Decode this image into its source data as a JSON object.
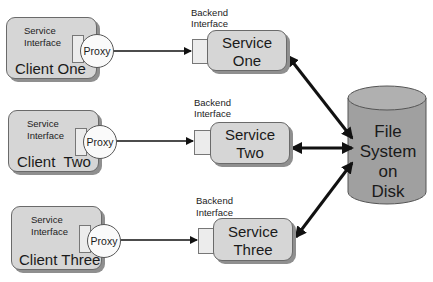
{
  "clients": [
    {
      "name": "Client One",
      "interface_label": [
        "Service",
        "Interface"
      ],
      "proxy_label": "Proxy"
    },
    {
      "name": "Client  Two",
      "interface_label": [
        "Service",
        "Interface"
      ],
      "proxy_label": "Proxy"
    },
    {
      "name": "Client Three",
      "interface_label": [
        "Service",
        "Interface"
      ],
      "proxy_label": "Proxy"
    }
  ],
  "services": [
    {
      "name_line1": "Service",
      "name_line2": "One",
      "interface_label": [
        "Backend",
        "Interface"
      ]
    },
    {
      "name_line1": "Service",
      "name_line2": "Two",
      "interface_label": [
        "Backend",
        "Interface"
      ]
    },
    {
      "name_line1": "Service",
      "name_line2": "Three",
      "interface_label": [
        "Backend",
        "Interface"
      ]
    }
  ],
  "storage": {
    "lines": [
      "File",
      "System",
      "on",
      "Disk"
    ]
  },
  "colors": {
    "box_fill": "#d6d6d6",
    "disk_fill": "#a0a0a0",
    "arrow": "#111111"
  }
}
